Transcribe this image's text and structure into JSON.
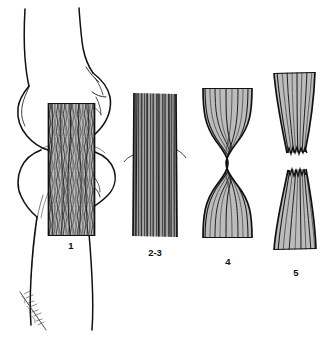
{
  "figure": {
    "background_color": "#ffffff",
    "ink_color": "#111111",
    "fiber_color": "#3a3a3a",
    "fill_color": "#b9b9b9",
    "panels": [
      {
        "id": "panel-1",
        "label": "1",
        "caption_text": "1",
        "description": "Normal ligament spanning knee joint between femoral condyle and tibia",
        "fiber_pattern": "dense-wavy",
        "shape": "rectangular",
        "has_anatomy": true
      },
      {
        "id": "panel-2-3",
        "label": "2-3",
        "caption_text": "2-3",
        "description": "Ligament with straight parallel fibers, mild sprain",
        "fiber_pattern": "straight-parallel",
        "shape": "rectangular",
        "has_anatomy": false
      },
      {
        "id": "panel-4",
        "label": "4",
        "caption_text": "4",
        "description": "Stretched ligament with hourglass necking at midsubstance",
        "fiber_pattern": "drawn-hourglass",
        "shape": "hourglass",
        "has_anatomy": false
      },
      {
        "id": "panel-5",
        "label": "5",
        "caption_text": "5",
        "description": "Complete rupture with retracted torn fiber ends and gap",
        "fiber_pattern": "torn-frayed",
        "shape": "ruptured-two-parts",
        "has_anatomy": false
      }
    ],
    "anatomy": {
      "name": "knee-joint-outline",
      "parts": [
        "femur-shaft",
        "femoral-condyle",
        "joint-line",
        "tibial-plateau",
        "tibia-shaft",
        "fibula-head"
      ]
    },
    "signature": {
      "present": true,
      "legible": false,
      "position": "bottom-left"
    }
  }
}
